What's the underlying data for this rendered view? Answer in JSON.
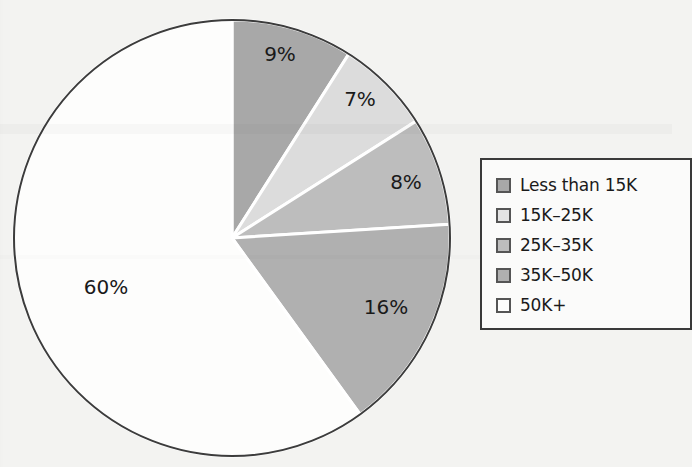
{
  "chart_data": {
    "type": "pie",
    "title": "",
    "subtitle": "",
    "xlabel": "",
    "ylabel": "",
    "legend_position": "right",
    "grid": false,
    "categories": [
      "Less than 15K",
      "15K–25K",
      "25K–35K",
      "35K–50K",
      "50K+"
    ],
    "values": [
      9,
      7,
      8,
      16,
      60
    ],
    "value_unit": "%",
    "slice_labels": [
      "9%",
      "7%",
      "8%",
      "16%",
      "60%"
    ],
    "colors": [
      "#a8a8a8",
      "#dcdcdc",
      "#bdbdbd",
      "#b0b0b0",
      "#fdfdfc"
    ],
    "start_angle_deg": 0,
    "direction": "clockwise",
    "slices": [
      {
        "label": "Less than 15K",
        "value": 9,
        "display": "9%",
        "color": "#a8a8a8",
        "start_deg": 0,
        "end_deg": 32.4,
        "label_x": 280,
        "label_y": 55
      },
      {
        "label": "15K–25K",
        "value": 7,
        "display": "7%",
        "color": "#dcdcdc",
        "start_deg": 32.4,
        "end_deg": 57.6,
        "label_x": 360,
        "label_y": 100
      },
      {
        "label": "25K–35K",
        "value": 8,
        "display": "8%",
        "color": "#bdbdbd",
        "start_deg": 57.6,
        "end_deg": 86.4,
        "label_x": 406,
        "label_y": 183
      },
      {
        "label": "35K–50K",
        "value": 16,
        "display": "16%",
        "color": "#b0b0b0",
        "start_deg": 86.4,
        "end_deg": 144.0,
        "label_x": 386,
        "label_y": 308
      },
      {
        "label": "50K+",
        "value": 60,
        "display": "60%",
        "color": "#fdfdfc",
        "start_deg": 144.0,
        "end_deg": 360.0,
        "label_x": 106,
        "label_y": 288
      }
    ],
    "geometry": {
      "cx": 232,
      "cy": 238,
      "r": 218
    }
  },
  "legend": {
    "items": [
      {
        "label": "Less than 15K",
        "color": "#a8a8a8"
      },
      {
        "label": "15K–25K",
        "color": "#e4e4e4"
      },
      {
        "label": "25K–35K",
        "color": "#bdbdbd"
      },
      {
        "label": "35K–50K",
        "color": "#b0b0b0"
      },
      {
        "label": "50K+",
        "color": "#fdfdfc"
      }
    ]
  }
}
